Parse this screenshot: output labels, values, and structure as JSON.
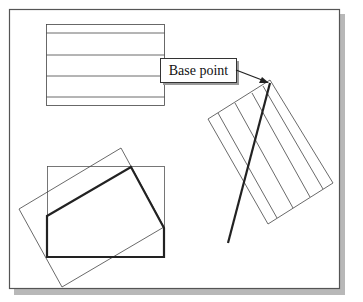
{
  "diagram": {
    "callout": {
      "label": "Base point"
    },
    "colors": {
      "frame_border": "#555555",
      "shadow": "#b5b5b5",
      "thin_line": "#333333",
      "thick_line": "#222222",
      "background": "#ffffff"
    }
  }
}
